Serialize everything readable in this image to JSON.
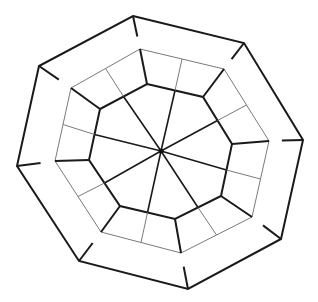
{
  "diagram": {
    "title": "",
    "sides": 8,
    "rings": [
      {
        "name": "inner-ring",
        "style": "bold"
      },
      {
        "name": "middle-ring",
        "style": "thin"
      },
      {
        "name": "outer-ring",
        "style": "bold"
      }
    ],
    "spokes": 8,
    "colors": {
      "line": "#1a1a1a",
      "thin_line": "#7a7a7a",
      "background": "#ffffff"
    }
  }
}
